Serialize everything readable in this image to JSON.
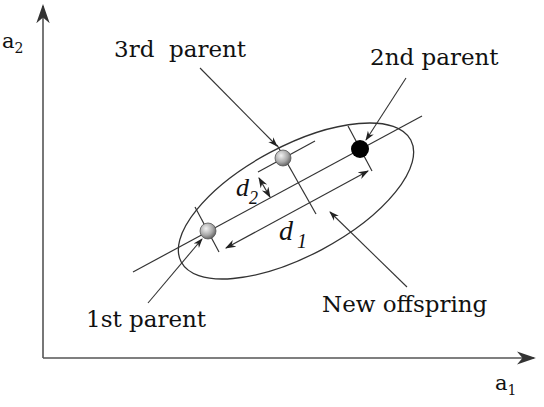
{
  "diagram": {
    "type": "parent-centric crossover illustration",
    "axes": {
      "x_label": "a",
      "x_sub": "1",
      "y_label": "a",
      "y_sub": "2"
    },
    "labels": {
      "third_parent": "3rd  parent",
      "second_parent": "2nd parent",
      "first_parent": "1st parent",
      "new_offspring": "New offspring",
      "d1": "d",
      "d1_sub": "1",
      "d2": "d",
      "d2_sub": "2"
    },
    "points": [
      {
        "name": "1st parent",
        "x": 208,
        "y": 231,
        "style": "gray-sphere"
      },
      {
        "name": "3rd parent",
        "x": 283,
        "y": 158,
        "style": "gray-sphere"
      },
      {
        "name": "2nd parent",
        "x": 360,
        "y": 149,
        "style": "black-filled"
      }
    ],
    "colors": {
      "ink": "#222222",
      "second_parent_fill": "#000000",
      "sphere_light": "#e8e8e8",
      "sphere_dark": "#6a6a6a"
    }
  }
}
